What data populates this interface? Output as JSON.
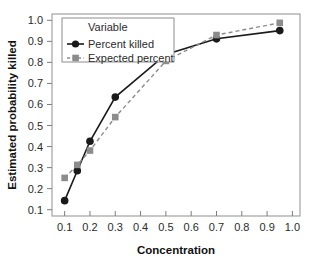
{
  "chart_data": {
    "type": "line",
    "title": "",
    "xlabel": "Concentration",
    "ylabel": "Estimated probability killed",
    "xlim": [
      0.05,
      1.03
    ],
    "ylim": [
      0.07,
      1.03
    ],
    "xticks": [
      "0.1",
      "0.2",
      "0.3",
      "0.4",
      "0.5",
      "0.6",
      "0.7",
      "0.8",
      "0.9",
      "1.0"
    ],
    "xtick_values": [
      0.1,
      0.2,
      0.3,
      0.4,
      0.5,
      0.6,
      0.7,
      0.8,
      0.9,
      1.0
    ],
    "yticks": [
      "0.1",
      "0.2",
      "0.3",
      "0.4",
      "0.5",
      "0.6",
      "0.7",
      "0.8",
      "0.9",
      "1.0"
    ],
    "ytick_values": [
      0.1,
      0.2,
      0.3,
      0.4,
      0.5,
      0.6,
      0.7,
      0.8,
      0.9,
      1.0
    ],
    "grid": false,
    "legend_position": "upper-left",
    "legend_title": "Variable",
    "series": [
      {
        "name": "Percent killed",
        "marker": "circle",
        "linestyle": "solid",
        "color": "#1a1a1a",
        "x": [
          0.1,
          0.15,
          0.2,
          0.3,
          0.5,
          0.7,
          0.95
        ],
        "values": [
          0.143,
          0.285,
          0.425,
          0.635,
          0.838,
          0.912,
          0.951
        ]
      },
      {
        "name": "Expected percent",
        "marker": "square",
        "linestyle": "dashed",
        "color": "#8c8c8c",
        "x": [
          0.1,
          0.15,
          0.2,
          0.3,
          0.5,
          0.7,
          0.95
        ],
        "values": [
          0.251,
          0.313,
          0.381,
          0.54,
          0.807,
          0.93,
          0.988
        ]
      }
    ]
  },
  "legend": {
    "title": "Variable",
    "entries": [
      {
        "label": "Percent killed"
      },
      {
        "label": "Expected percent"
      }
    ]
  },
  "axes": {
    "x_title": "Concentration",
    "y_title": "Estimated probability killed"
  },
  "colors": {
    "series_1": "#1a1a1a",
    "series_2": "#8c8c8c",
    "frame": "#9a9a9a",
    "text": "#2b2b2b",
    "background": "#ffffff"
  }
}
